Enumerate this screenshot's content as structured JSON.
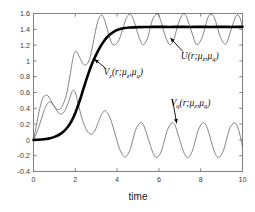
{
  "chart_data": {
    "type": "line",
    "title": "",
    "subtitle": "",
    "xlabel": "time",
    "ylabel": "",
    "xlim": [
      0,
      10
    ],
    "ylim": [
      -0.4,
      1.6
    ],
    "xticks": [
      0,
      2,
      4,
      6,
      8,
      10
    ],
    "xticklabels": [
      "0",
      "2",
      "4",
      "6",
      "8",
      "10"
    ],
    "yticks": [
      -0.4,
      -0.2,
      0,
      0.2,
      0.4,
      0.6,
      0.8,
      1,
      1.2,
      1.4,
      1.6
    ],
    "yticklabels": [
      "-0.4",
      "-0.2",
      "0",
      "0.2",
      "0.4",
      "0.6",
      "0.8",
      "1",
      "1.2",
      "1.4",
      "1.6"
    ],
    "grid": false,
    "legend_position": "none",
    "annotations": [
      {
        "id": "U",
        "label_main": "U(r;μ",
        "label_sub1": "z",
        "label_mid": ",μ",
        "label_sub2": "q",
        "label_close": ")",
        "text": "U(r;μ_z,μ_q)",
        "label_x": 7.05,
        "label_y": 1.03,
        "arrow_to_x": 6.55,
        "arrow_to_y": 1.29
      },
      {
        "id": "Vz",
        "label_main": "V",
        "label_sub0": "z",
        "label_paren": "(r;μ",
        "label_sub1": "z",
        "label_mid": ",μ",
        "label_sub2": "q",
        "label_close": ")",
        "text": "V_z(r;μ_z,μ_q)",
        "label_x": 3.35,
        "label_y": 0.82,
        "arrow_to_x": 2.92,
        "arrow_to_y": 1.02
      },
      {
        "id": "Vq",
        "label_main": "V",
        "label_sub0": "q",
        "label_paren": "(r;μ",
        "label_sub1": "z",
        "label_mid": ",μ",
        "label_sub2": "q",
        "label_close": ")",
        "text": "V_q(r;μ_z,μ_q)",
        "label_x": 6.55,
        "label_y": 0.43,
        "arrow_to_x": 6.85,
        "arrow_to_y": 0.21
      }
    ],
    "series": [
      {
        "name": "U(r;μ_z,μ_q)",
        "style": "thick-solid-black",
        "color": "#000000",
        "linewidth": 2.6,
        "description": "Monotone sigmoid rising from 0 to steady state 1.43, no oscillation",
        "steady_state": 1.43,
        "x": [
          0.0,
          0.2,
          0.4,
          0.6,
          0.8,
          1.0,
          1.2,
          1.4,
          1.6,
          1.8,
          2.0,
          2.2,
          2.4,
          2.6,
          2.8,
          3.0,
          3.2,
          3.4,
          3.6,
          3.8,
          4.0,
          4.3,
          4.6,
          5.0,
          5.5,
          6.0,
          6.5,
          7.0,
          7.5,
          8.0,
          8.5,
          9.0,
          9.5,
          10.0
        ],
        "y": [
          0.0,
          0.002,
          0.005,
          0.012,
          0.022,
          0.038,
          0.062,
          0.098,
          0.15,
          0.228,
          0.34,
          0.487,
          0.655,
          0.82,
          0.965,
          1.08,
          1.18,
          1.262,
          1.322,
          1.362,
          1.39,
          1.412,
          1.422,
          1.428,
          1.43,
          1.431,
          1.43,
          1.431,
          1.43,
          1.431,
          1.43,
          1.431,
          1.43,
          1.431
        ]
      },
      {
        "name": "V_z(r;μ_z,μ_q)",
        "style": "thin-solid-gray",
        "color": "#6e6e6e",
        "linewidth": 0.85,
        "description": "Oscillatory, grows with transient bumps then settles into limit cycle between 1.20 and 1.60 with period about 1.30",
        "steady_min": 1.2,
        "steady_max": 1.6,
        "period": 1.3,
        "x": [
          0.0,
          0.15,
          0.3,
          0.45,
          0.6,
          0.7,
          0.85,
          1.0,
          1.15,
          1.3,
          1.45,
          1.6,
          1.75,
          1.9,
          2.0,
          2.1,
          2.25,
          2.4,
          2.55,
          2.7,
          2.85,
          3.0,
          3.1,
          3.25,
          3.4,
          3.55,
          3.7,
          3.8,
          3.95,
          4.1,
          4.3,
          4.45,
          4.6,
          4.75,
          4.95,
          5.1,
          5.25,
          5.45,
          5.6,
          5.75,
          5.95,
          6.1,
          6.25,
          6.45,
          6.6,
          6.75,
          6.9,
          7.1,
          7.25,
          7.4,
          7.6,
          7.75,
          7.9,
          8.1,
          8.25,
          8.4,
          8.6,
          8.75,
          8.9,
          9.1,
          9.25,
          9.4,
          9.6,
          9.75,
          9.9,
          10.0
        ],
        "y": [
          0.0,
          0.2,
          0.4,
          0.53,
          0.565,
          0.555,
          0.49,
          0.42,
          0.385,
          0.4,
          0.47,
          0.6,
          0.82,
          1.05,
          1.12,
          1.1,
          1.02,
          0.955,
          0.955,
          1.04,
          1.22,
          1.42,
          1.52,
          1.58,
          1.52,
          1.38,
          1.25,
          1.205,
          1.215,
          1.27,
          1.43,
          1.545,
          1.59,
          1.545,
          1.38,
          1.265,
          1.205,
          1.28,
          1.44,
          1.555,
          1.59,
          1.5,
          1.36,
          1.225,
          1.215,
          1.3,
          1.45,
          1.575,
          1.59,
          1.5,
          1.34,
          1.225,
          1.215,
          1.32,
          1.47,
          1.575,
          1.575,
          1.47,
          1.33,
          1.225,
          1.23,
          1.35,
          1.51,
          1.585,
          1.53,
          1.42
        ]
      },
      {
        "name": "V_q(r;μ_z,μ_q)",
        "style": "thin-solid-gray",
        "color": "#6e6e6e",
        "linewidth": 0.85,
        "description": "Oscillatory starting at 0, transient rise and dip, settles into limit cycle between -0.22 and 0.22 with period about 1.30",
        "steady_min": -0.22,
        "steady_max": 0.22,
        "period": 1.3,
        "x": [
          0.0,
          0.15,
          0.3,
          0.45,
          0.6,
          0.75,
          0.9,
          1.05,
          1.2,
          1.35,
          1.5,
          1.65,
          1.8,
          1.9,
          2.0,
          2.1,
          2.2,
          2.35,
          2.5,
          2.65,
          2.8,
          2.95,
          3.1,
          3.25,
          3.4,
          3.5,
          3.65,
          3.8,
          3.95,
          4.1,
          4.25,
          4.4,
          4.6,
          4.75,
          4.9,
          5.1,
          5.25,
          5.4,
          5.6,
          5.75,
          5.9,
          6.1,
          6.25,
          6.4,
          6.6,
          6.75,
          6.9,
          7.1,
          7.25,
          7.4,
          7.6,
          7.75,
          7.9,
          8.1,
          8.25,
          8.4,
          8.6,
          8.75,
          8.9,
          9.1,
          9.25,
          9.4,
          9.6,
          9.75,
          9.9,
          10.0
        ],
        "y": [
          0.0,
          0.09,
          0.2,
          0.33,
          0.43,
          0.48,
          0.46,
          0.4,
          0.34,
          0.33,
          0.37,
          0.46,
          0.58,
          0.63,
          0.6,
          0.5,
          0.39,
          0.245,
          0.145,
          0.085,
          0.075,
          0.125,
          0.22,
          0.32,
          0.37,
          0.355,
          0.29,
          0.17,
          0.03,
          -0.1,
          -0.185,
          -0.215,
          -0.14,
          0.0,
          0.135,
          0.215,
          0.195,
          0.09,
          -0.075,
          -0.185,
          -0.225,
          -0.155,
          -0.02,
          0.12,
          0.215,
          0.195,
          0.085,
          -0.09,
          -0.19,
          -0.225,
          -0.14,
          0.0,
          0.135,
          0.215,
          0.19,
          0.08,
          -0.105,
          -0.2,
          -0.22,
          -0.125,
          0.02,
          0.155,
          0.215,
          0.175,
          0.04,
          -0.09
        ]
      }
    ]
  }
}
